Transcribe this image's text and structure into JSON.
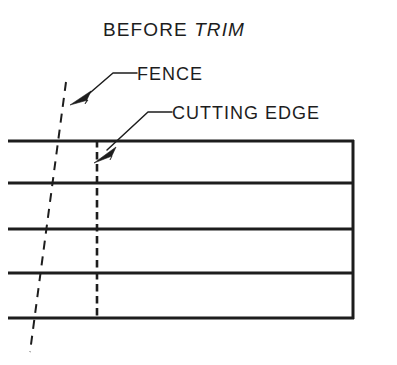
{
  "figure": {
    "title_main": "BEFORE",
    "title_italic": "TRIM",
    "title_full": "BEFORE TRIM",
    "background_color": "#ffffff",
    "line_color": "#1d1d1d"
  },
  "callouts": [
    {
      "id": "fence",
      "label": "FENCE",
      "points_to": "fence-line"
    },
    {
      "id": "cutting-edge",
      "label": "CUTTING EDGE",
      "points_to": "cutting-edge-line"
    }
  ],
  "diagram_data": {
    "type": "technical-drawing",
    "description": "CAD TRIM command illustration: a set of horizontal lines crossed by a slanted dashed fence line and a vertical dashed cutting edge",
    "board": {
      "horizontal_lines_y": [
        141,
        183,
        229,
        273,
        318
      ],
      "x_start": 8,
      "x_end": 354,
      "right_edge_x": 354,
      "left_edge": "open"
    },
    "fence_line": {
      "style": "dashed",
      "from": [
        66,
        82
      ],
      "to": [
        30,
        352
      ],
      "slope_note": "slants down-left, extends past top and bottom lines"
    },
    "cutting_edge_line": {
      "style": "dashed",
      "x": 97,
      "from_y": 141,
      "to_y": 318
    }
  }
}
